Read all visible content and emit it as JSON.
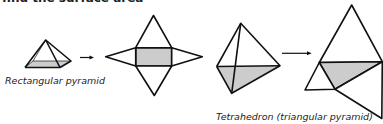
{
  "header": {
    "truncated_text": "find the surface area"
  },
  "figures": [
    {
      "id": "rectangular-pyramid",
      "label": "Rectangular pyramid",
      "net_description": "rectangle base with four triangular faces"
    },
    {
      "id": "tetrahedron",
      "label": "Tetrahedron (triangular pyramid)",
      "net_description": "triangle base with three triangular faces"
    }
  ],
  "colors": {
    "stroke": "#111111",
    "base_fill": "#cccccc",
    "background": "#ffffff"
  }
}
